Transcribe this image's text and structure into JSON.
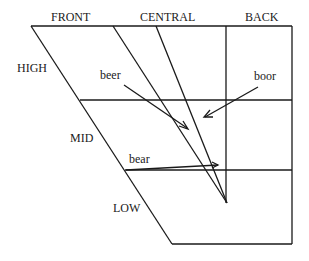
{
  "diagram": {
    "type": "vowel-quadrilateral",
    "column_labels": [
      "FRONT",
      "CENTRAL",
      "BACK"
    ],
    "row_labels": [
      "HIGH",
      "MID",
      "LOW"
    ],
    "words": {
      "beer": "beer",
      "boor": "boor",
      "bear": "bear"
    },
    "colors": {
      "ink": "#1a1a1a",
      "background": "#ffffff"
    }
  }
}
